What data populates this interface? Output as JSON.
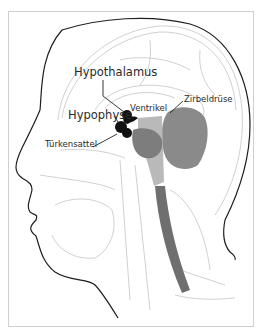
{
  "figure": {
    "labels": {
      "hypothalamus": "Hypothalamus",
      "hypophyse": "Hypophyse",
      "ventrikel": "Ventrikel",
      "zirbeldruese": "Zirbeldrüse",
      "tuerkensattel": "Türkensattel"
    },
    "colors": {
      "outline": "#1e1e1e",
      "sketch": "#bdbdbd",
      "highlight_gland": "#111111",
      "brain_dark": "#7a7a7a",
      "cerebellum": "#8a8a8a",
      "brainstem_light": "#b9b9b9",
      "spinal_cord": "#6f6f6f",
      "frame": "#cfcfcf"
    }
  }
}
